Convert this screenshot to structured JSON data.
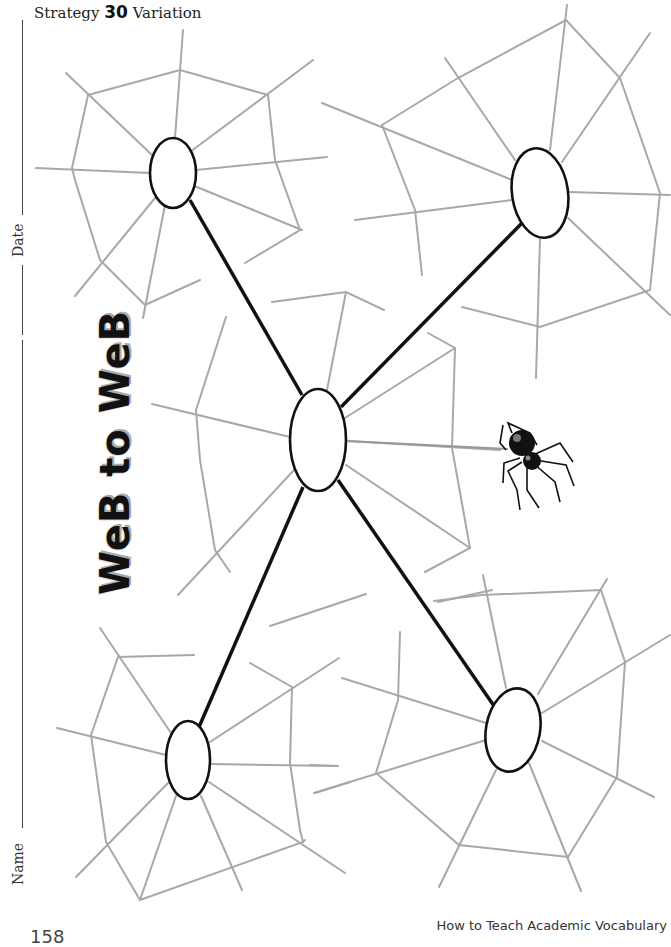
{
  "header": {
    "prefix": "Strategy",
    "number": "30",
    "suffix": "Variation"
  },
  "side_fields": {
    "date_label": "Date",
    "name_label": "Name"
  },
  "title": "WeB to WeB",
  "footer": {
    "book_title": "How to Teach Academic Vocabulary",
    "page_number": "158"
  },
  "diagram": {
    "type": "web organizer",
    "center_node": {
      "id": "center",
      "cx": 318,
      "cy": 440,
      "rx": 28,
      "ry": 51,
      "text": ""
    },
    "outer_nodes": [
      {
        "id": "top-left",
        "cx": 173,
        "cy": 173,
        "rx": 23,
        "ry": 35,
        "text": ""
      },
      {
        "id": "top-right",
        "cx": 540,
        "cy": 193,
        "rx": 28,
        "ry": 45,
        "text": ""
      },
      {
        "id": "bottom-left",
        "cx": 188,
        "cy": 760,
        "rx": 22,
        "ry": 39,
        "text": ""
      },
      {
        "id": "bottom-right",
        "cx": 513,
        "cy": 730,
        "rx": 27,
        "ry": 42,
        "text": ""
      }
    ],
    "decoration": {
      "spider": "spider-icon"
    }
  }
}
